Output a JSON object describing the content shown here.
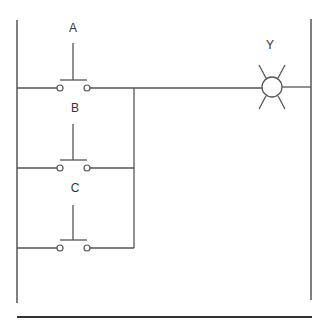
{
  "diagram": {
    "type": "ladder-logic",
    "inputs": [
      {
        "label": "A",
        "kind": "normally-open pushbutton"
      },
      {
        "label": "B",
        "kind": "normally-open pushbutton"
      },
      {
        "label": "C",
        "kind": "normally-open pushbutton"
      }
    ],
    "output": {
      "label": "Y",
      "kind": "lamp"
    },
    "logic": "Y = A OR B OR C"
  },
  "colors": {
    "line": "#555555",
    "background": "#ffffff"
  }
}
